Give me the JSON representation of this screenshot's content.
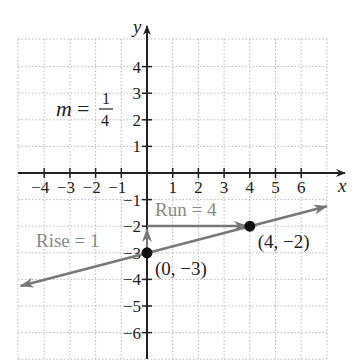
{
  "chart_data": {
    "type": "line",
    "title": "",
    "xlabel": "x",
    "ylabel": "y",
    "xlim": [
      -5,
      7
    ],
    "ylim": [
      -7,
      5
    ],
    "grid": true,
    "x_ticks": [
      -4,
      -3,
      -2,
      -1,
      1,
      2,
      3,
      4,
      5,
      6
    ],
    "y_ticks": [
      4,
      3,
      2,
      1,
      -1,
      -2,
      -3,
      -4,
      -5,
      -6
    ],
    "x_tick_labels": [
      "−4",
      "−3",
      "−2",
      "−1",
      "1",
      "2",
      "3",
      "4",
      "5",
      "6"
    ],
    "y_tick_labels": [
      "4",
      "3",
      "2",
      "1",
      "−1",
      "−2",
      "−3",
      "−4",
      "−5",
      "−6"
    ],
    "series": [
      {
        "name": "line",
        "slope": 0.25,
        "intercept": -3,
        "x": [
          -5,
          7
        ],
        "y": [
          -4.25,
          -1.25
        ],
        "color": "#777777"
      }
    ],
    "points": [
      {
        "x": 0,
        "y": -3,
        "label": "(0, −3)"
      },
      {
        "x": 4,
        "y": -2,
        "label": "(4, −2)"
      }
    ],
    "annotations": {
      "slope": {
        "m": "m",
        "eq": "=",
        "num": "1",
        "den": "4"
      },
      "rise": "Rise = 1",
      "run": "Run = 4"
    }
  },
  "colors": {
    "axis": "#222222",
    "grid": "#b8b8b8",
    "line": "#777777",
    "annotation": "#888888",
    "point": "#111111"
  }
}
